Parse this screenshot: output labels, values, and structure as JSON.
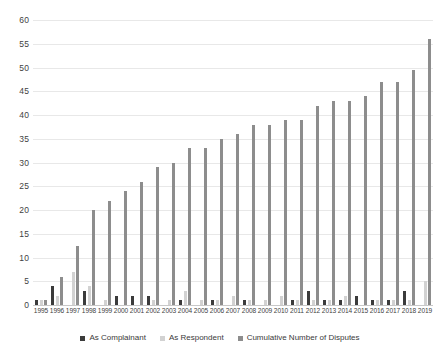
{
  "chart_data": {
    "type": "bar",
    "title": "",
    "subtitle": "",
    "xlabel": "",
    "ylabel": "",
    "ylim": [
      0,
      60
    ],
    "ytick_step": 5,
    "yticks": [
      0,
      5,
      10,
      15,
      20,
      25,
      30,
      35,
      40,
      45,
      50,
      55,
      60
    ],
    "grid": true,
    "legend_position": "bottom",
    "categories": [
      "1995",
      "1996",
      "1997",
      "1998",
      "1999",
      "2000",
      "2001",
      "2002",
      "2003",
      "2004",
      "2005",
      "2006",
      "2007",
      "2008",
      "2009",
      "2010",
      "2011",
      "2012",
      "2013",
      "2014",
      "2015",
      "2016",
      "2017",
      "2018",
      "2019"
    ],
    "series": [
      {
        "name": "As Complainant",
        "color": "#3b3b3b",
        "values": [
          1,
          4,
          0,
          3,
          0,
          2,
          2,
          2,
          0,
          1,
          0,
          1,
          0,
          1,
          0,
          0,
          1,
          3,
          1,
          1,
          2,
          1,
          1,
          3,
          0
        ]
      },
      {
        "name": "As Respondent",
        "color": "#d2d2d2",
        "values": [
          1,
          2,
          7,
          4,
          1,
          0,
          0,
          1,
          1,
          3,
          1,
          1,
          2,
          1,
          1,
          2,
          1,
          1,
          1,
          2,
          0,
          1,
          1,
          1,
          5
        ]
      },
      {
        "name": "Cumulative Number of Disputes",
        "color": "#8d8d8d",
        "values": [
          1,
          6,
          12.5,
          20,
          22,
          24,
          26,
          29,
          30,
          33,
          33,
          35,
          36,
          38,
          38,
          39,
          39,
          42,
          43,
          43,
          44,
          47,
          47,
          49.5,
          56
        ]
      }
    ]
  },
  "legend": {
    "items": [
      {
        "label": "As Complainant",
        "color": "#3b3b3b",
        "icon": "square-swatch-icon"
      },
      {
        "label": "As Respondent",
        "color": "#d2d2d2",
        "icon": "square-swatch-icon"
      },
      {
        "label": "Cumulative Number of Disputes",
        "color": "#8d8d8d",
        "icon": "square-swatch-icon"
      }
    ]
  }
}
